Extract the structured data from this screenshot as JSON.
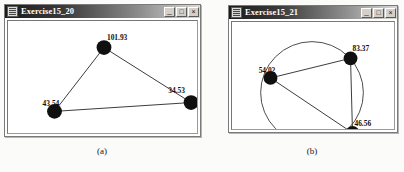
{
  "figure": {
    "captions": [
      {
        "id": "a",
        "text": "(a)"
      },
      {
        "id": "b",
        "text": "(b)"
      }
    ]
  },
  "windows": [
    {
      "id": "exercise15_20",
      "title": "Exercise15_20",
      "icon": "app-window-icon",
      "buttons": [
        {
          "name": "minimize-button",
          "glyph": "_"
        },
        {
          "name": "maximize-button",
          "glyph": "□"
        },
        {
          "name": "close-button",
          "glyph": "×"
        }
      ],
      "graph": {
        "type": "triangle-graph",
        "nodes": [
          {
            "label": "101.93",
            "x": 97,
            "y": 27,
            "label_x": 100,
            "label_y": 19
          },
          {
            "label": "34.53",
            "x": 185,
            "y": 83,
            "label_x": 163,
            "label_y": 73
          },
          {
            "label": "43.54",
            "x": 47,
            "y": 92,
            "label_x": 38,
            "label_y": 86
          }
        ],
        "edges": [
          {
            "from": 0,
            "to": 1
          },
          {
            "from": 1,
            "to": 2
          },
          {
            "from": 2,
            "to": 0
          }
        ]
      }
    },
    {
      "id": "exercise15_21",
      "title": "Exercise15_21",
      "icon": "app-window-icon",
      "buttons": [
        {
          "name": "minimize-button",
          "glyph": "_"
        },
        {
          "name": "maximize-button",
          "glyph": "□"
        },
        {
          "name": "close-button",
          "glyph": "×"
        }
      ],
      "graph": {
        "type": "circle-graph",
        "circle": {
          "cx": 81,
          "cy": 72,
          "r": 52
        },
        "nodes": [
          {
            "label": "83.37",
            "x": 120,
            "y": 37,
            "label_x": 122,
            "label_y": 30
          },
          {
            "label": "54.02",
            "x": 39,
            "y": 57,
            "label_x": 30,
            "label_y": 51
          },
          {
            "label": "46.56",
            "x": 122,
            "y": 113,
            "label_x": 124,
            "label_y": 107
          }
        ],
        "edges": [
          {
            "from": 0,
            "to": 1
          },
          {
            "from": 0,
            "to": 2
          },
          {
            "from": 1,
            "to": 2
          }
        ]
      }
    }
  ],
  "colors": {
    "node": "#101010",
    "edge": "#3a3a3a",
    "titlebar_dark": "#1b1b1b",
    "titlebar_light": "#d8d8d8",
    "window_border": "#7a7a7a",
    "page_background": "#fbfbfa"
  }
}
